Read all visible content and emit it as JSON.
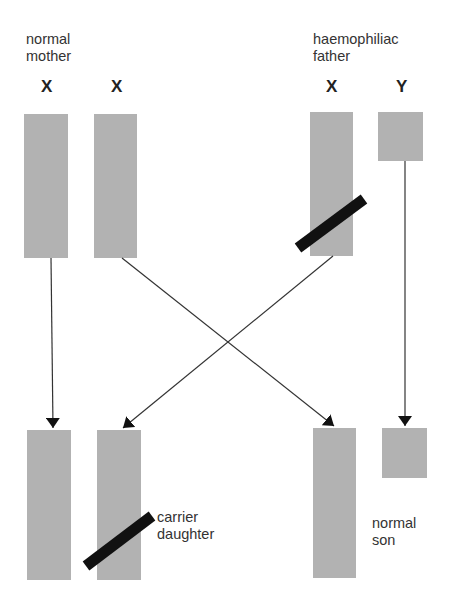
{
  "parents": {
    "mother": {
      "label_line1": "normal",
      "label_line2": "mother",
      "chromosomes": [
        {
          "letter": "X",
          "affected": false
        },
        {
          "letter": "X",
          "affected": false
        }
      ]
    },
    "father": {
      "label_line1": "haemophiliac",
      "label_line2": "father",
      "chromosomes": [
        {
          "letter": "X",
          "affected": true
        },
        {
          "letter": "Y",
          "affected": false
        }
      ]
    }
  },
  "offspring": {
    "daughter": {
      "label_line1": "carrier",
      "label_line2": "daughter",
      "chromosomes": [
        {
          "source": "mother X",
          "affected": false
        },
        {
          "source": "father X",
          "affected": true
        }
      ]
    },
    "son": {
      "label_line1": "normal",
      "label_line2": "son",
      "chromosomes": [
        {
          "source": "mother X",
          "affected": false
        },
        {
          "source": "father Y",
          "affected": false
        }
      ]
    }
  },
  "colors": {
    "chromosome": "#b2b2b2",
    "defect_band": "#111111",
    "arrow": "#333333"
  }
}
